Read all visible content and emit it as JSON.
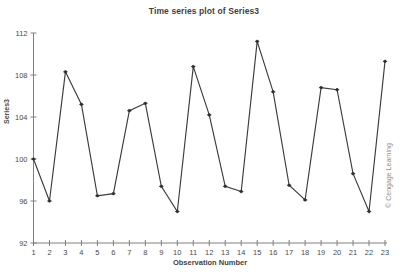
{
  "chart_data": {
    "type": "line",
    "title": "Time series plot of Series3",
    "xlabel": "Observation Number",
    "ylabel": "Series3",
    "x": [
      1,
      2,
      3,
      4,
      5,
      6,
      7,
      8,
      9,
      10,
      11,
      12,
      13,
      14,
      15,
      16,
      17,
      18,
      19,
      20,
      21,
      22,
      23
    ],
    "values": [
      100.0,
      96.0,
      108.3,
      105.2,
      96.5,
      96.7,
      104.6,
      105.3,
      97.4,
      95.0,
      108.8,
      104.2,
      97.4,
      96.9,
      111.2,
      106.4,
      97.5,
      96.1,
      106.8,
      106.6,
      98.6,
      95.0,
      109.3
    ],
    "series": [
      {
        "name": "Series3",
        "values": [
          100.0,
          96.0,
          108.3,
          105.2,
          96.5,
          96.7,
          104.6,
          105.3,
          97.4,
          95.0,
          108.8,
          104.2,
          97.4,
          96.9,
          111.2,
          106.4,
          97.5,
          96.1,
          106.8,
          106.6,
          98.6,
          95.0,
          109.3
        ]
      }
    ],
    "xlim": [
      1,
      23
    ],
    "ylim": [
      92,
      112
    ],
    "yticks": [
      92,
      96,
      100,
      104,
      108,
      112
    ],
    "ytick_labels": [
      "92",
      "96",
      "100",
      "104",
      "108",
      "112"
    ],
    "xticks": [
      1,
      2,
      3,
      4,
      5,
      6,
      7,
      8,
      9,
      10,
      11,
      12,
      13,
      14,
      15,
      16,
      17,
      18,
      19,
      20,
      21,
      22,
      23
    ],
    "xtick_labels": [
      "1",
      "2",
      "3",
      "4",
      "5",
      "6",
      "7",
      "8",
      "9",
      "10",
      "11",
      "12",
      "13",
      "14",
      "15",
      "16",
      "17",
      "18",
      "19",
      "20",
      "21",
      "22",
      "23"
    ],
    "grid": false,
    "legend": false,
    "marker": "dot",
    "line_color": "#3c3c3c",
    "marker_color": "#2e2e2e",
    "axis_color": "#808080",
    "background": "#ffffff"
  },
  "watermark": {
    "text": "© Cengage Learning"
  }
}
